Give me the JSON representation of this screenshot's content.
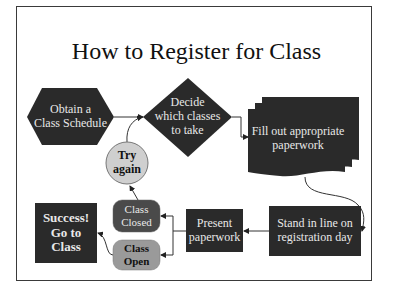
{
  "title": "How to Register for Class",
  "colors": {
    "shape_dark": "#2a2a2a",
    "class_closed": "#4a4a4a",
    "class_open": "#9a9a9a",
    "try_again": "#cfcfcf",
    "frame": "#3a3a3a",
    "text_light": "#e8e8e8",
    "text_dark": "#111111"
  },
  "nodes": {
    "obtain": {
      "shape": "hexagon",
      "label_line1": "Obtain a",
      "label_line2": "Class Schedule"
    },
    "decide": {
      "shape": "diamond",
      "label_line1": "Decide",
      "label_line2": "which classes",
      "label_line3": "to take"
    },
    "fill": {
      "shape": "multi-document",
      "label_line1": "Fill out appropriate",
      "label_line2": "paperwork"
    },
    "stand": {
      "shape": "rectangle",
      "label_line1": "Stand in line on",
      "label_line2": "registration day"
    },
    "present": {
      "shape": "rectangle",
      "label_line1": "Present",
      "label_line2": "paperwork"
    },
    "closed": {
      "shape": "rounded-rectangle",
      "label_line1": "Class",
      "label_line2": "Closed"
    },
    "open": {
      "shape": "rounded-rectangle",
      "label_line1": "Class",
      "label_line2": "Open"
    },
    "try": {
      "shape": "circle",
      "label_line1": "Try",
      "label_line2": "again"
    },
    "success": {
      "shape": "rectangle",
      "label_line1": "Success!",
      "label_line2": "Go to",
      "label_line3": "Class"
    }
  },
  "edges": [
    {
      "from": "Obtain a Class Schedule",
      "to": "Decide which classes to take"
    },
    {
      "from": "Decide which classes to take",
      "to": "Fill out appropriate paperwork"
    },
    {
      "from": "Fill out appropriate paperwork",
      "to": "Stand in line on registration day"
    },
    {
      "from": "Stand in line on registration day",
      "to": "Present paperwork"
    },
    {
      "from": "Present paperwork",
      "to": "Class Closed"
    },
    {
      "from": "Present paperwork",
      "to": "Class Open"
    },
    {
      "from": "Class Closed",
      "to": "Try again"
    },
    {
      "from": "Try again",
      "to": "Decide which classes to take"
    },
    {
      "from": "Class Open",
      "to": "Success! Go to Class"
    }
  ]
}
